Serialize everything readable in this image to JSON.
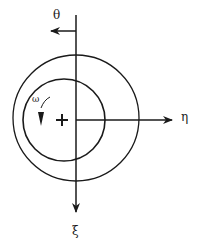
{
  "diagram": {
    "type": "rotating-disk-coordinate-frame",
    "labels": {
      "theta": "θ",
      "eta": "η",
      "xi": "ξ",
      "omega": "ω"
    },
    "colors": {
      "stroke": "#1a1a1a",
      "background": "#ffffff"
    },
    "axes": [
      {
        "name": "xi-axis",
        "direction": "down",
        "label": "ξ"
      },
      {
        "name": "eta-axis",
        "direction": "right",
        "label": "η"
      },
      {
        "name": "theta-arrow",
        "direction": "left",
        "label": "θ"
      }
    ],
    "circles": [
      {
        "name": "outer-circle",
        "cx": 76,
        "cy": 118,
        "r": 63
      },
      {
        "name": "inner-circle",
        "cx": 64,
        "cy": 120,
        "r": 41
      }
    ],
    "center_marker": {
      "symbol": "+",
      "x": 62,
      "y": 120
    },
    "rotation": {
      "label": "ω",
      "direction": "clockwise"
    }
  }
}
